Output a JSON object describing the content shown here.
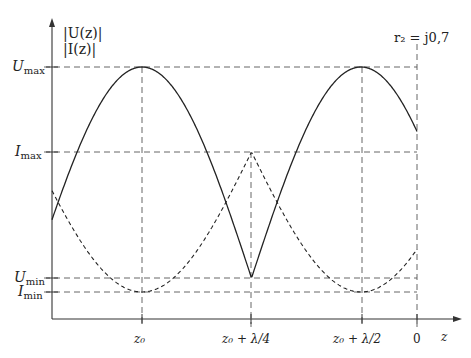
{
  "y_axis": {
    "label_line1": "|U(z)|",
    "label_line2": "|I(z)|"
  },
  "x_axis": {
    "label": "z"
  },
  "annotation": "r₂ = j0,7",
  "y_ticks": [
    {
      "name": "U",
      "sub": "max"
    },
    {
      "name": "I",
      "sub": "max"
    },
    {
      "name": "U",
      "sub": "min"
    },
    {
      "name": "I",
      "sub": "min"
    }
  ],
  "x_ticks": [
    "z₀",
    "z₀ + λ/4",
    "z₀ + λ/2",
    "0"
  ],
  "colors": {
    "curves": "#222222",
    "guides": "#555555"
  },
  "chart_data": {
    "type": "line",
    "title": "",
    "xlabel": "z",
    "ylabel": "|U(z)|, |I(z)|",
    "x_ticks": [
      "z₀",
      "z₀ + λ/4",
      "z₀ + λ/2",
      "0"
    ],
    "y_ticks": [
      "I_min",
      "U_min",
      "I_max",
      "U_max"
    ],
    "series": [
      {
        "name": "|U(z)|",
        "style": "solid",
        "maxima_at": [
          "z₀",
          "z₀ + λ/2"
        ],
        "minima_at": [
          "z₀ + λ/4"
        ],
        "value_at_0": "between U_max and I_max"
      },
      {
        "name": "|I(z)|",
        "style": "dashed",
        "maxima_at": [
          "z₀ + λ/4"
        ],
        "minima_at": [
          "z₀",
          "z₀ + λ/2"
        ],
        "value_at_0": "between I_max and U_min"
      }
    ],
    "grid": false
  }
}
